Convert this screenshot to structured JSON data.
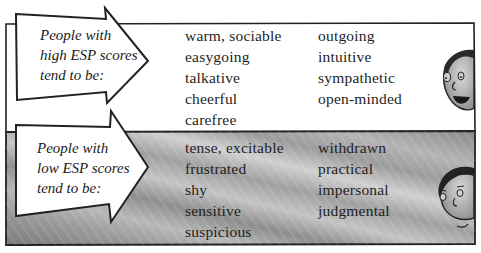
{
  "high": {
    "label_lines": [
      "People with",
      "high ESP scores",
      "tend to be:"
    ],
    "traits_col1": [
      "warm, sociable",
      "easygoing",
      "talkative",
      "cheerful",
      "carefree"
    ],
    "traits_col2": [
      "outgoing",
      "intuitive",
      "sympathetic",
      "open-minded"
    ],
    "face": "smiling-face-icon"
  },
  "low": {
    "label_lines": [
      "People with",
      "low ESP scores",
      "tend to be:"
    ],
    "traits_col1": [
      "tense, excitable",
      "frustrated",
      "shy",
      "sensitive",
      "suspicious"
    ],
    "traits_col2": [
      "withdrawn",
      "practical",
      "impersonal",
      "judgmental"
    ],
    "face": "neutral-face-icon"
  },
  "colors": {
    "outline": "#222222",
    "high_bg": "#ffffff",
    "low_bg": "#8c8c8c",
    "arrow_fill": "#ffffff"
  }
}
